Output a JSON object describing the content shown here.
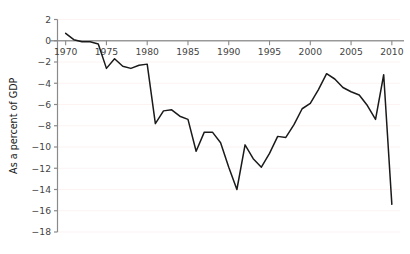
{
  "chart_data": {
    "type": "line",
    "title": "",
    "subtitle": "",
    "xlabel": "",
    "ylabel": "As a percent of GDP",
    "xlim": [
      1969.0,
      2011.0
    ],
    "ylim": [
      -18,
      2
    ],
    "grid": true,
    "grid_orientation": "horizontal",
    "legend": null,
    "legend_position": "none",
    "line_color": "#1a1a1a",
    "zero_axis_color": "#999999",
    "x_ticks": [
      1970,
      1975,
      1980,
      1985,
      1990,
      1995,
      2000,
      2005,
      2010
    ],
    "x_tick_labels": [
      "1970",
      "1975",
      "1980",
      "1985",
      "1990",
      "1995",
      "2000",
      "2005",
      "2010"
    ],
    "y_ticks": [
      2,
      0,
      -2,
      -4,
      -6,
      -8,
      -10,
      -12,
      -14,
      -16,
      -18
    ],
    "y_tick_labels": [
      "2",
      "0",
      "−2",
      "−4",
      "−6",
      "−8",
      "−10",
      "−12",
      "−14",
      "−16",
      "−18"
    ],
    "series": [
      {
        "name": "Balance as a percent of GDP",
        "color": "#1a1a1a",
        "x": [
          1970,
          1971,
          1972,
          1973,
          1974,
          1975,
          1976,
          1977,
          1978,
          1979,
          1980,
          1981,
          1982,
          1983,
          1984,
          1985,
          1986,
          1987,
          1988,
          1989,
          1990,
          1991,
          1992,
          1993,
          1994,
          1995,
          1996,
          1997,
          1998,
          1999,
          2000,
          2001,
          2002,
          2003,
          2004,
          2005,
          2006,
          2007,
          2008,
          2009,
          2010
        ],
        "values": [
          0.7,
          0.1,
          -0.1,
          -0.1,
          -0.3,
          -2.6,
          -1.7,
          -2.4,
          -2.6,
          -2.3,
          -2.2,
          -7.8,
          -6.6,
          -6.5,
          -7.1,
          -7.4,
          -10.4,
          -8.6,
          -8.6,
          -9.6,
          -11.9,
          -14.0,
          -9.8,
          -11.1,
          -11.9,
          -10.6,
          -9.0,
          -9.1,
          -7.9,
          -6.4,
          -5.9,
          -4.6,
          -3.1,
          -3.6,
          -4.4,
          -4.8,
          -5.1,
          -6.1,
          -7.4,
          -3.2,
          -15.4
        ]
      }
    ]
  }
}
